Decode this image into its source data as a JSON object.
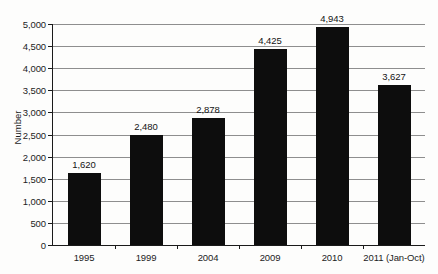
{
  "chart_data": {
    "type": "bar",
    "title": "",
    "xlabel": "",
    "ylabel": "Number",
    "categories": [
      "1995",
      "1999",
      "2004",
      "2009",
      "2010",
      "2011 (Jan-Oct)"
    ],
    "values": [
      1620,
      2480,
      2878,
      4425,
      4943,
      3627
    ],
    "value_labels": [
      "1,620",
      "2,480",
      "2,878",
      "4,425",
      "4,943",
      "3,627"
    ],
    "ylim": [
      0,
      5000
    ],
    "ytick_values": [
      0,
      500,
      1000,
      1500,
      2000,
      2500,
      3000,
      3500,
      4000,
      4500,
      5000
    ],
    "ytick_labels": [
      "0",
      "500",
      "1,000",
      "1,500",
      "2,000",
      "2,500",
      "3,000",
      "3,500",
      "4,000",
      "4,500",
      "5,000"
    ],
    "grid": true,
    "legend": "none",
    "bar_color": "#0d0d0d",
    "gridline_color": "#8e8e8e",
    "axis_color": "#1a1a1a",
    "background_color": "#fdfdfc"
  }
}
